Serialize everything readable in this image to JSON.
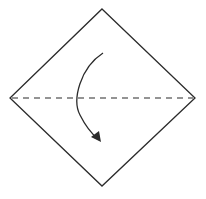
{
  "diagram": {
    "type": "origami-fold-instruction",
    "shape": "square-paper-diamond-orientation",
    "fold_line": "valley-fold-horizontal-diagonal",
    "action": "fold-top-corner-down",
    "colors": {
      "stroke": "#2b2b2b",
      "background": "#ffffff"
    }
  }
}
